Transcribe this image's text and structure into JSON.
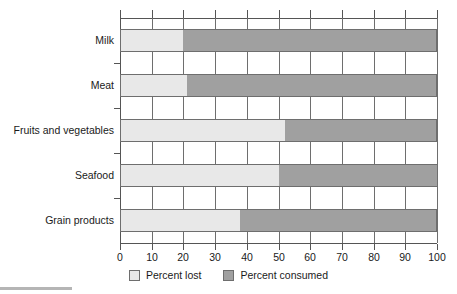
{
  "chart_data": {
    "type": "bar",
    "orientation": "horizontal",
    "stacked": true,
    "title": "",
    "xlabel": "",
    "ylabel": "",
    "xlim": [
      0,
      100
    ],
    "xticks": [
      0,
      10,
      20,
      30,
      40,
      50,
      60,
      70,
      80,
      90,
      100
    ],
    "xtick_labels": [
      "0",
      "10",
      "20",
      "30",
      "40",
      "50",
      "60",
      "70",
      "80",
      "90",
      "100"
    ],
    "grid": true,
    "grid_axis": "x",
    "legend_position": "bottom-center",
    "categories": [
      "Milk",
      "Meat",
      "Fruits and vegetables",
      "Seafood",
      "Grain products"
    ],
    "series": [
      {
        "name": "Percent lost",
        "color": "#e8e8e8",
        "values": [
          20,
          21,
          52,
          50,
          38
        ]
      },
      {
        "name": "Percent consumed",
        "color": "#a0a0a0",
        "values": [
          80,
          79,
          48,
          50,
          62
        ]
      }
    ]
  },
  "legend": {
    "items": [
      {
        "label": "Percent lost",
        "color": "#e8e8e8"
      },
      {
        "label": "Percent consumed",
        "color": "#a0a0a0"
      }
    ]
  },
  "colors": {
    "lost": "#e8e8e8",
    "consumed": "#a0a0a0",
    "axis": "#555555",
    "grid": "#6e6e6e",
    "text": "#1a1a1a",
    "background": "#ffffff"
  }
}
